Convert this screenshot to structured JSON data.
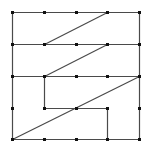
{
  "diagram": {
    "type": "grid-line-puzzle",
    "grid": {
      "rows": 5,
      "cols": 5,
      "coords": [
        12,
        44,
        76,
        107,
        139
      ]
    },
    "colors": {
      "background": "#ffffff",
      "line": "#4a4a4a",
      "dot": "#111111"
    },
    "dots": [
      [
        12,
        12
      ],
      [
        44,
        12
      ],
      [
        76,
        12
      ],
      [
        107,
        12
      ],
      [
        139,
        12
      ],
      [
        12,
        44
      ],
      [
        44,
        44
      ],
      [
        76,
        44
      ],
      [
        107,
        44
      ],
      [
        139,
        44
      ],
      [
        12,
        76
      ],
      [
        44,
        76
      ],
      [
        76,
        76
      ],
      [
        107,
        76
      ],
      [
        139,
        76
      ],
      [
        12,
        108
      ],
      [
        44,
        108
      ],
      [
        76,
        108
      ],
      [
        107,
        108
      ],
      [
        139,
        108
      ],
      [
        12,
        139
      ],
      [
        44,
        139
      ],
      [
        76,
        139
      ],
      [
        107,
        139
      ],
      [
        139,
        139
      ]
    ],
    "segments": [
      {
        "name": "border-top",
        "from": [
          12,
          12
        ],
        "to": [
          139,
          12
        ]
      },
      {
        "name": "border-right",
        "from": [
          139,
          12
        ],
        "to": [
          139,
          139
        ]
      },
      {
        "name": "border-bottom",
        "from": [
          12,
          139
        ],
        "to": [
          139,
          139
        ]
      },
      {
        "name": "border-left",
        "from": [
          12,
          12
        ],
        "to": [
          12,
          139
        ]
      },
      {
        "name": "row-2-horizontal",
        "from": [
          12,
          44
        ],
        "to": [
          139,
          44
        ]
      },
      {
        "name": "row-3-horizontal",
        "from": [
          12,
          76
        ],
        "to": [
          139,
          76
        ]
      },
      {
        "name": "diagonal-upper",
        "from": [
          44,
          44
        ],
        "to": [
          107,
          12
        ]
      },
      {
        "name": "diagonal-middle",
        "from": [
          44,
          76
        ],
        "to": [
          107,
          44
        ]
      },
      {
        "name": "inner-vertical-left",
        "from": [
          44,
          76
        ],
        "to": [
          44,
          108
        ]
      },
      {
        "name": "inner-horizontal",
        "from": [
          44,
          108
        ],
        "to": [
          107,
          108
        ]
      },
      {
        "name": "inner-vertical-right",
        "from": [
          107,
          108
        ],
        "to": [
          107,
          139
        ]
      },
      {
        "name": "diagonal-long",
        "from": [
          12,
          139
        ],
        "to": [
          139,
          76
        ]
      }
    ]
  }
}
